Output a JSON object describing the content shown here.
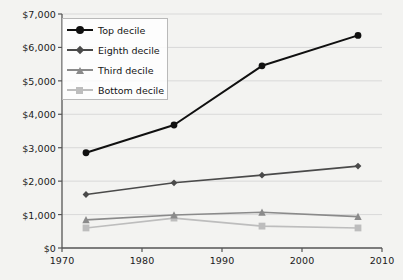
{
  "chart_data": {
    "type": "line",
    "title": "",
    "subtitle": "",
    "xlabel": "",
    "ylabel": "",
    "x": [
      1973,
      1984,
      1995,
      2007
    ],
    "xlim": [
      1970,
      2010
    ],
    "ylim": [
      0,
      7000
    ],
    "grid": true,
    "grid_axis": "y",
    "legend_position": "upper left",
    "x_ticks": [
      "1970",
      "1980",
      "1990",
      "2000",
      "2010"
    ],
    "x_tick_values": [
      1970,
      1980,
      1990,
      2000,
      2010
    ],
    "y_ticks": [
      "$0",
      "$1,000",
      "$2,000",
      "$3,000",
      "$4,000",
      "$5,000",
      "$6,000",
      "$7,000"
    ],
    "y_tick_values": [
      0,
      1000,
      2000,
      3000,
      4000,
      5000,
      6000,
      7000
    ],
    "series": [
      {
        "name": "Top decile",
        "color": "#101010",
        "marker": "circle",
        "values": [
          2850,
          3680,
          5450,
          6360
        ]
      },
      {
        "name": "Eighth decile",
        "color": "#4a4a4a",
        "marker": "diamond",
        "values": [
          1600,
          1950,
          2180,
          2450
        ]
      },
      {
        "name": "Third decile",
        "color": "#8a8a8a",
        "marker": "triangle",
        "values": [
          840,
          985,
          1070,
          940
        ]
      },
      {
        "name": "Bottom decile",
        "color": "#bdbdbd",
        "marker": "square",
        "values": [
          600,
          895,
          655,
          600
        ]
      }
    ]
  },
  "legend": {
    "items": [
      {
        "label": "Top decile"
      },
      {
        "label": "Eighth decile"
      },
      {
        "label": "Third decile"
      },
      {
        "label": "Bottom decile"
      }
    ]
  },
  "colors": {
    "background": "#f3f3f1",
    "axis": "#555555",
    "grid": "#d9d9d9",
    "text": "#1a1a1a"
  },
  "source_note": ""
}
